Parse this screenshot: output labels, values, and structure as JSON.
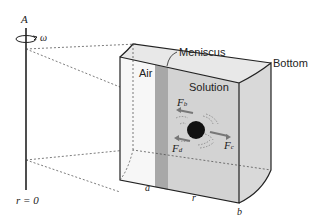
{
  "diagram": {
    "type": "centrifuge-sector-cell",
    "axis": {
      "label": "A",
      "rotation_symbol": "ω",
      "origin_label": "r = 0"
    },
    "cell": {
      "regions": [
        "Air",
        "Solution"
      ],
      "labels": {
        "meniscus": "Meniscus",
        "bottom": "Bottom",
        "air": "Air",
        "solution": "Solution"
      },
      "positions": {
        "a": "a",
        "r": "r",
        "b": "b"
      }
    },
    "forces": [
      {
        "symbol": "F",
        "subscript": "b",
        "direction": "left (toward axis)"
      },
      {
        "symbol": "F",
        "subscript": "d",
        "direction": "left (toward axis)"
      },
      {
        "symbol": "F",
        "subscript": "c",
        "direction": "right (away from axis)"
      }
    ],
    "colors": {
      "cell_fill": "#d9d9d9",
      "meniscus_band": "#a8a8a8",
      "outline": "#222222",
      "particle": "#111111"
    }
  }
}
